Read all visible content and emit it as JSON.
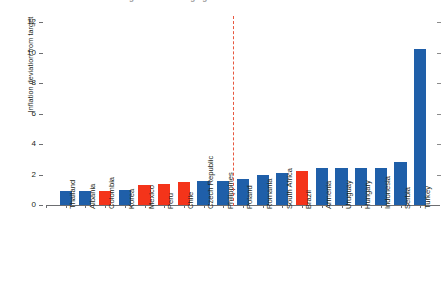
{
  "title_partial": "Inflation deviation from target across emerging markets",
  "axis": {
    "ylabel": "Inflation deviation from target",
    "yticks": [
      "0",
      "2",
      "4",
      "6",
      "8",
      "10",
      "12"
    ]
  },
  "colors": {
    "blue": "#1f5fa9",
    "red": "#f4341a",
    "divider": "#e8573f",
    "axis": "#6d6e71"
  },
  "chart_data": {
    "type": "bar",
    "title": "Inflation deviation from target across emerging markets",
    "xlabel": "",
    "ylabel": "Inflation deviation from target",
    "ylim": [
      0,
      12
    ],
    "yticks": [
      0,
      2,
      4,
      6,
      8,
      10,
      12
    ],
    "grid": false,
    "legend": "none",
    "categories": [
      "Thailand",
      "Albania",
      "Colombia",
      "Korea",
      "Mexico",
      "Peru",
      "Chile",
      "Czech Republic",
      "Philippines",
      "Poland",
      "Romania",
      "South Africa",
      "Brazil",
      "Armenia",
      "Uruguay",
      "Hungary",
      "Indonesia",
      "Serbia",
      "Turkey"
    ],
    "values": [
      0.9,
      0.9,
      0.9,
      1.0,
      1.3,
      1.4,
      1.5,
      1.6,
      1.6,
      1.7,
      2.0,
      2.1,
      2.2,
      2.4,
      2.4,
      2.4,
      2.4,
      2.8,
      10.2
    ],
    "point_colors": [
      "blue",
      "blue",
      "red",
      "blue",
      "red",
      "red",
      "red",
      "blue",
      "blue",
      "blue",
      "blue",
      "blue",
      "red",
      "blue",
      "blue",
      "blue",
      "blue",
      "blue",
      "blue"
    ],
    "annotations": [
      {
        "type": "vline",
        "label": "threshold-divider",
        "after_category": "Philippines",
        "style": "dashed",
        "color": "#e8573f"
      }
    ]
  }
}
